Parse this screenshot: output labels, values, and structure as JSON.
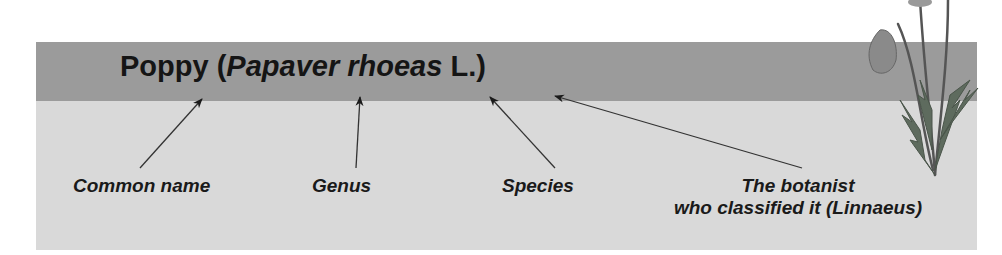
{
  "title": {
    "common": "Poppy",
    "open_paren": "(",
    "genus": "Papaver",
    "species": "rhoeas",
    "author": "L.",
    "close_paren": ")"
  },
  "labels": {
    "common_name": "Common name",
    "genus": "Genus",
    "species": "Species",
    "botanist_line1": "The botanist",
    "botanist_line2": "who classified it (Linnaeus)"
  },
  "colors": {
    "band_dark": "#9b9b9b",
    "band_light": "#d9d9d9",
    "text": "#151515",
    "arrow": "#333333"
  },
  "illustration": "poppy-plant-icon"
}
